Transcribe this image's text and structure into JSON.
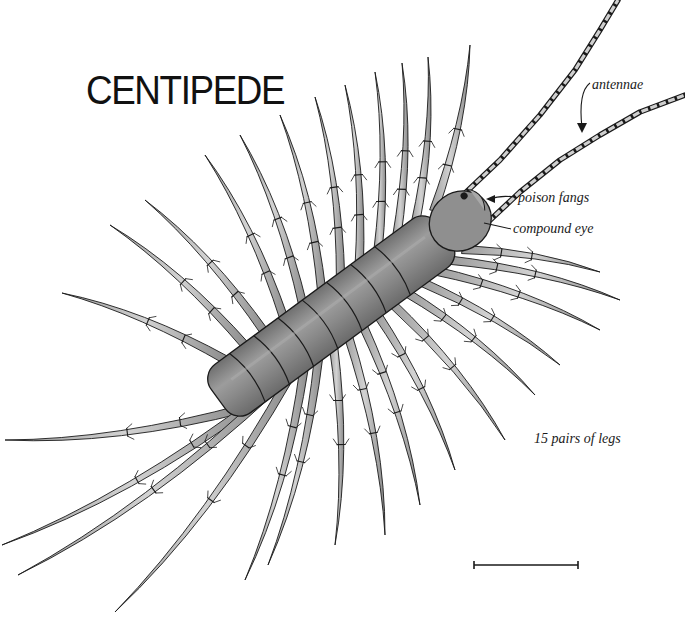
{
  "title": "CENTIPEDE",
  "labels": {
    "antennae": "antennae",
    "poison_fangs": "poison fangs",
    "compound_eye": "compound eye",
    "legs": "15 pairs of legs"
  },
  "scale_bar": {
    "x1": 474,
    "x2": 578,
    "y": 565
  },
  "colors": {
    "ink": "#1a1a1a",
    "body_fill": "#8c8c8c",
    "leg_fill": "#b4b4b4",
    "background": "#ffffff"
  },
  "anatomy": {
    "body_segments": 8,
    "leg_pairs": 15
  }
}
